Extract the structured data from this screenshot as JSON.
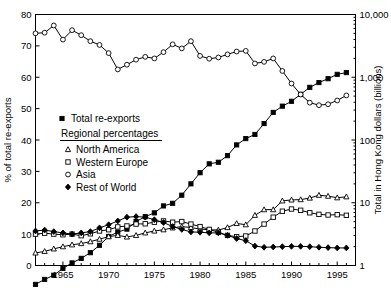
{
  "chart_data": {
    "type": "line",
    "title": "",
    "xlabel": "",
    "ylabel": "% of total re-exports",
    "y2label": "Total in Hong Kong dollars (billions)",
    "xlim": [
      1962,
      1997
    ],
    "ylim": [
      0,
      80
    ],
    "y2lim": [
      1,
      10000
    ],
    "y2scale": "log",
    "grid": false,
    "legend_position": "inside-left",
    "xticks": [
      1965,
      1970,
      1975,
      1980,
      1985,
      1990,
      1995
    ],
    "xticklabels": [
      "1965",
      "1970",
      "1975",
      "1980",
      "1985",
      "1990",
      "1995"
    ],
    "xminor_interval": 1,
    "yticks": [
      0,
      10,
      20,
      30,
      40,
      50,
      60,
      70,
      80
    ],
    "yticklabels": [
      "0",
      "10",
      "20",
      "30",
      "40",
      "50",
      "60",
      "70",
      "80"
    ],
    "y2ticks": [
      1,
      10,
      100,
      1000,
      10000
    ],
    "y2ticklabels": [
      "1",
      "10",
      "100",
      "1,000",
      "10,000"
    ],
    "x": [
      1962,
      1963,
      1964,
      1965,
      1966,
      1967,
      1968,
      1969,
      1970,
      1971,
      1972,
      1973,
      1974,
      1975,
      1976,
      1977,
      1978,
      1979,
      1980,
      1981,
      1982,
      1983,
      1984,
      1985,
      1986,
      1987,
      1988,
      1989,
      1990,
      1991,
      1992,
      1993,
      1994,
      1995,
      1996
    ],
    "series": [
      {
        "name": "Total re-exports",
        "marker": "filled-square",
        "axis": "right",
        "units": "billions of Hong Kong dollars",
        "values": [
          0.5,
          0.6,
          0.7,
          0.9,
          1.1,
          1.3,
          1.6,
          2.1,
          2.9,
          3.4,
          3.8,
          5.0,
          6.0,
          6.9,
          8.9,
          9.8,
          13.2,
          20.0,
          30.1,
          41.7,
          44.2,
          56.3,
          83.5,
          105.3,
          122.5,
          182.8,
          275.4,
          346.4,
          413.9,
          534.8,
          690.8,
          823.2,
          947.9,
          1112.5,
          1185.8
        ]
      },
      {
        "name": "North America",
        "marker": "open-triangle",
        "axis": "left",
        "units": "% of total re-exports",
        "values": [
          4.0,
          4.5,
          5.3,
          6.0,
          6.6,
          7.0,
          7.6,
          8.4,
          9.2,
          9.6,
          9.1,
          9.6,
          10.4,
          11.0,
          11.4,
          12.0,
          12.4,
          12.1,
          11.6,
          11.4,
          11.3,
          12.1,
          13.4,
          13.0,
          16.0,
          17.8,
          17.8,
          20.6,
          20.9,
          21.0,
          21.5,
          22.4,
          22.1,
          21.6,
          21.9
        ]
      },
      {
        "name": "Western Europe",
        "marker": "open-square",
        "axis": "left",
        "units": "% of total re-exports",
        "values": [
          10.0,
          10.3,
          10.0,
          9.8,
          10.0,
          9.5,
          10.1,
          11.0,
          11.4,
          12.3,
          12.6,
          13.2,
          13.3,
          13.8,
          14.2,
          13.8,
          14.0,
          13.2,
          12.4,
          11.5,
          10.6,
          9.6,
          9.2,
          9.4,
          11.0,
          13.2,
          15.4,
          17.3,
          18.0,
          17.6,
          16.8,
          16.3,
          16.1,
          16.2,
          16.0
        ]
      },
      {
        "name": "Asia",
        "marker": "open-circle",
        "axis": "left",
        "units": "% of total re-exports",
        "values": [
          74.0,
          74.2,
          76.5,
          72.0,
          75.0,
          73.4,
          71.5,
          70.3,
          67.7,
          62.5,
          64.0,
          65.6,
          66.5,
          66.0,
          68.0,
          70.5,
          69.2,
          71.5,
          66.8,
          65.9,
          66.3,
          67.3,
          68.2,
          68.4,
          64.4,
          64.9,
          66.0,
          62.0,
          58.0,
          54.5,
          51.9,
          51.1,
          51.4,
          52.6,
          54.2
        ]
      },
      {
        "name": "Rest of World",
        "marker": "filled-diamond",
        "axis": "left",
        "units": "% of total re-exports",
        "values": [
          11.0,
          11.3,
          10.8,
          10.4,
          10.0,
          10.4,
          10.8,
          12.0,
          13.0,
          14.2,
          15.4,
          15.6,
          15.4,
          14.6,
          13.7,
          12.4,
          11.5,
          10.7,
          10.6,
          10.4,
          10.4,
          9.6,
          8.6,
          7.9,
          6.2,
          5.8,
          5.9,
          6.0,
          6.1,
          6.1,
          6.0,
          5.8,
          5.7,
          5.6,
          5.6
        ]
      }
    ]
  },
  "legend": {
    "total_label": "Total re-exports",
    "section_heading": "Regional percentages",
    "items": [
      {
        "label": "North America"
      },
      {
        "label": "Western Europe"
      },
      {
        "label": "Asia"
      },
      {
        "label": "Rest of World"
      }
    ]
  }
}
